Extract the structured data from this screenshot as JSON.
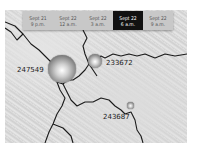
{
  "timeline": {
    "ticks": [
      {
        "date": "Sept 21",
        "time": "9 p.m."
      },
      {
        "date": "Sept 22",
        "time": "12 a.m."
      },
      {
        "date": "Sept 22",
        "time": "3 a.m."
      },
      {
        "date": "Sept 22",
        "time": "6 a.m."
      },
      {
        "date": "Sept 22",
        "time": "9 a.m."
      }
    ],
    "active_index": 3
  },
  "markers": [
    {
      "label": "247549",
      "size": "large"
    },
    {
      "label": "233672",
      "size": "medium"
    },
    {
      "label": "243687",
      "size": "small"
    }
  ],
  "colors": {
    "active_tick_bg": "#111111",
    "tick_bg": "#c8c8c8",
    "border_line": "#1a1a1a"
  }
}
